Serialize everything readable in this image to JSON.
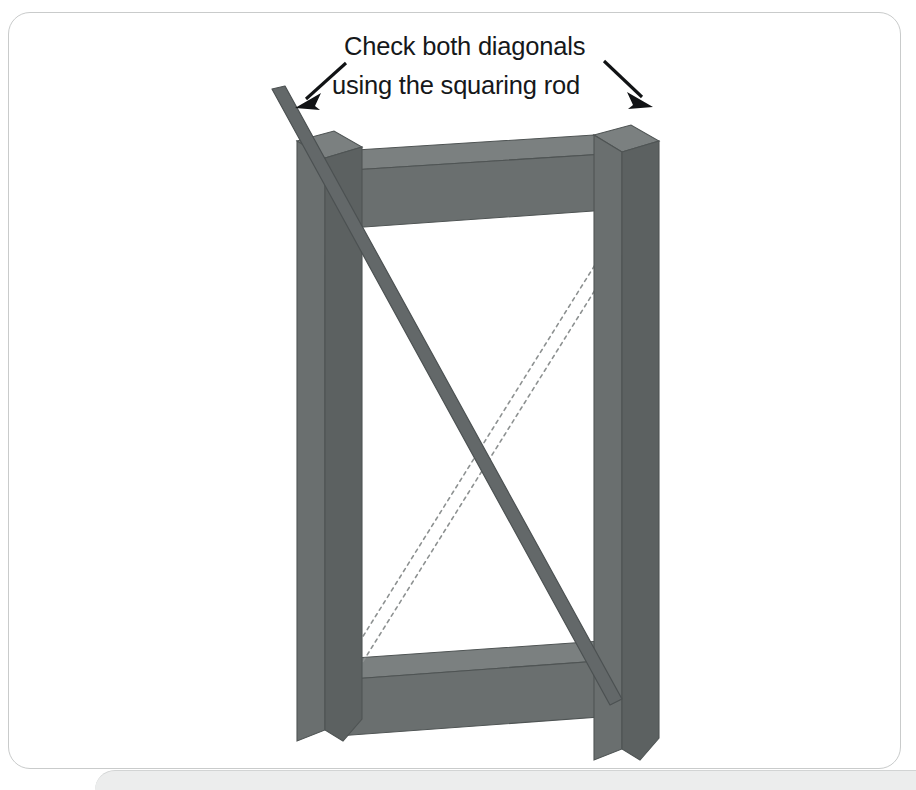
{
  "card": {
    "name": "squaring-rod-diagram-card",
    "background": "#ffffff",
    "border_color": "#c9cbcb"
  },
  "lower_panel": {
    "background": "#eceded",
    "border_color": "#d2d4d4"
  },
  "annotation": {
    "line1": "Check both diagonals",
    "line2": "using the squaring rod",
    "text_color": "#16181a",
    "arrow_color": "#111315",
    "left_arrow_name": "annotation-arrow-left",
    "right_arrow_name": "annotation-arrow-right"
  },
  "diagram": {
    "type": "isometric-woodworking-frame",
    "colors": {
      "timber_front": "#6a6f6f",
      "timber_top": "#7b8080",
      "timber_side": "#5c6161",
      "timber_edge": "#4f5454",
      "rod_solid": "#636869",
      "rod_dotted_stroke": "#8d9191"
    },
    "parts": [
      {
        "name": "left-post",
        "label": "Left post"
      },
      {
        "name": "right-post",
        "label": "Right post"
      },
      {
        "name": "top-rail",
        "label": "Top rail"
      },
      {
        "name": "bottom-rail",
        "label": "Bottom rail"
      },
      {
        "name": "squaring-rod-solid",
        "label": "Squaring rod in position (first diagonal)"
      },
      {
        "name": "squaring-rod-dotted",
        "label": "Squaring rod outline (second diagonal)"
      }
    ]
  }
}
